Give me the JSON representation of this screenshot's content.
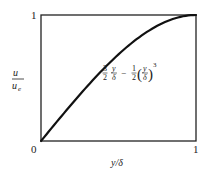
{
  "chart_data": {
    "type": "line",
    "title": "",
    "xlabel": "y/δ",
    "ylabel": "u / u_e",
    "ylabel_num": "u",
    "ylabel_den": "u",
    "ylabel_den_sub": "e",
    "xlim": [
      0,
      1
    ],
    "ylim": [
      0,
      1
    ],
    "x_ticks": [
      "0",
      "1"
    ],
    "y_ticks": [
      "0",
      "1"
    ],
    "grid": false,
    "legend": null,
    "annotation": "3/2 (y/δ) − 1/2 (y/δ)^3",
    "series": [
      {
        "name": "3/2 (y/δ) − 1/2 (y/δ)^3",
        "x": [
          0,
          0.1,
          0.2,
          0.3,
          0.4,
          0.5,
          0.6,
          0.7,
          0.8,
          0.9,
          1.0
        ],
        "y": [
          0,
          0.1495,
          0.296,
          0.4365,
          0.568,
          0.6875,
          0.792,
          0.8785,
          0.944,
          0.9855,
          1.0
        ]
      }
    ]
  },
  "labels": {
    "x_tick_0": "0",
    "x_tick_1": "1",
    "y_tick_1": "1",
    "xlabel": "y/δ",
    "ylabel_num": "u",
    "ylabel_den": "u",
    "ylabel_den_sub": "e",
    "eq_frac1_num": "3",
    "eq_frac1_den": "2",
    "eq_var_num": "y",
    "eq_var_den": "δ",
    "eq_minus": "−",
    "eq_frac2_num": "1",
    "eq_frac2_den": "2",
    "eq_paren_open": "(",
    "eq_paren_close": ")",
    "eq_var2_num": "y",
    "eq_var2_den": "δ",
    "eq_power": "3"
  },
  "colors": {
    "curve": "#111111",
    "axis": "#222222",
    "background": "#ffffff"
  }
}
